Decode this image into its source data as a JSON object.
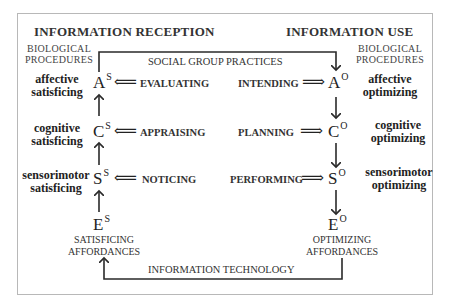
{
  "diagram": {
    "left_title": "INFORMATION RECEPTION",
    "right_title": "INFORMATION USE",
    "left_procedures": [
      "BIOLOGICAL",
      "PROCEDURES"
    ],
    "right_procedures": [
      "BIOLOGICAL",
      "PROCEDURES"
    ],
    "top_loop_label": "SOCIAL GROUP PRACTICES",
    "bottom_loop_label": "INFORMATION TECHNOLOGY",
    "left_column": {
      "nodes": [
        {
          "letter": "A",
          "sup": "S",
          "side": [
            "affective",
            "satisficing"
          ],
          "verb": "EVALUATING"
        },
        {
          "letter": "C",
          "sup": "S",
          "side": [
            "cognitive",
            "satisficing"
          ],
          "verb": "APPRAISING"
        },
        {
          "letter": "S",
          "sup": "S",
          "side": [
            "sensorimotor",
            "satisficing"
          ],
          "verb": "NOTICING"
        },
        {
          "letter": "E",
          "sup": "S"
        }
      ],
      "affordances": [
        "SATISFICING",
        "AFFORDANCES"
      ]
    },
    "right_column": {
      "nodes": [
        {
          "letter": "A",
          "sup": "O",
          "side": [
            "affective",
            "optimizing"
          ],
          "verb": "INTENDING"
        },
        {
          "letter": "C",
          "sup": "O",
          "side": [
            "cognitive",
            "optimizing"
          ],
          "verb": "PLANNING"
        },
        {
          "letter": "S",
          "sup": "O",
          "side": [
            "sensorimotor",
            "optimizing"
          ],
          "verb": "PERFORMING"
        },
        {
          "letter": "E",
          "sup": "O"
        }
      ],
      "affordances": [
        "OPTIMIZING",
        "AFFORDANCES"
      ]
    },
    "arrows": {
      "left_double": "⟸",
      "right_double": "⟹"
    },
    "colors": {
      "line": "#2a2a2a",
      "frame": "#b8b8b8",
      "text": "#2a2a2a"
    }
  }
}
